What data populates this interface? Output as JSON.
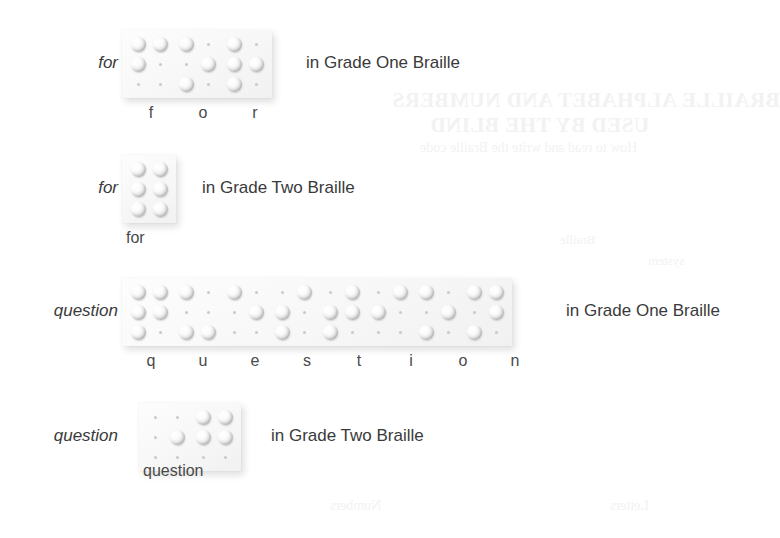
{
  "page": {
    "background_color": "#ffffff",
    "text_color": "#3a3a3a",
    "plaque_color": "#f7f7f7"
  },
  "bleed_through": {
    "title_line_1": "BRAILLE ALPHABET AND NUMBERS",
    "title_line_2": "USED BY THE BLIND",
    "subtitle": "How to read and write the Braille code",
    "word_a": "Braille",
    "word_b": "system",
    "word_c": "Numbers",
    "word_d": "Letters"
  },
  "rows": [
    {
      "id": "for-grade-one",
      "word": "for",
      "caption": "in Grade One Braille",
      "grade": "Grade One",
      "cells": [
        {
          "letter": "f",
          "dots": [
            1,
            2,
            4
          ]
        },
        {
          "letter": "o",
          "dots": [
            1,
            3,
            5
          ]
        },
        {
          "letter": "r",
          "dots": [
            1,
            2,
            3,
            5
          ]
        }
      ]
    },
    {
      "id": "for-grade-two",
      "word": "for",
      "caption": "in Grade Two Braille",
      "grade": "Grade Two",
      "sublabel": "for",
      "cells": [
        {
          "letter": "for",
          "dots": [
            1,
            2,
            3,
            4,
            5,
            6
          ]
        }
      ]
    },
    {
      "id": "question-grade-one",
      "word": "question",
      "caption": "in Grade One Braille",
      "grade": "Grade One",
      "cells": [
        {
          "letter": "q",
          "dots": [
            1,
            2,
            3,
            4,
            5
          ]
        },
        {
          "letter": "u",
          "dots": [
            1,
            3,
            6
          ]
        },
        {
          "letter": "e",
          "dots": [
            1,
            5
          ]
        },
        {
          "letter": "s",
          "dots": [
            2,
            3,
            4
          ]
        },
        {
          "letter": "t",
          "dots": [
            2,
            3,
            4,
            5
          ]
        },
        {
          "letter": "i",
          "dots": [
            2,
            4
          ]
        },
        {
          "letter": "o",
          "dots": [
            1,
            3,
            5
          ]
        },
        {
          "letter": "n",
          "dots": [
            1,
            3,
            4,
            5
          ]
        }
      ]
    },
    {
      "id": "question-grade-two",
      "word": "question",
      "caption": "in Grade Two Braille",
      "grade": "Grade Two",
      "sublabel": "question",
      "cells": [
        {
          "letter": "",
          "dots": [
            5
          ]
        },
        {
          "letter": "question",
          "dots": [
            1,
            2,
            4,
            5
          ]
        }
      ]
    }
  ]
}
